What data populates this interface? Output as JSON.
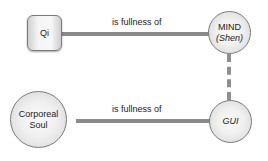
{
  "diagram": {
    "nodes": {
      "qi": {
        "label": "Qi"
      },
      "mind": {
        "label_line1": "MIND",
        "label_line2": "(Shen)"
      },
      "corporeal_soul": {
        "label_line1": "Corporeal",
        "label_line2": "Soul"
      },
      "gui": {
        "label": "GUI"
      }
    },
    "edges": {
      "top": {
        "label": "is fullness of",
        "from": "Qi",
        "to": "MIND (Shen)"
      },
      "bottom": {
        "label": "is fullness of",
        "from": "Corporeal Soul",
        "to": "GUI"
      },
      "vertical": {
        "from": "MIND (Shen)",
        "to": "GUI",
        "style": "dotted"
      }
    },
    "colors": {
      "line": "#8a8a8a",
      "node_border": "#7a7a7a",
      "text": "#222222"
    }
  }
}
